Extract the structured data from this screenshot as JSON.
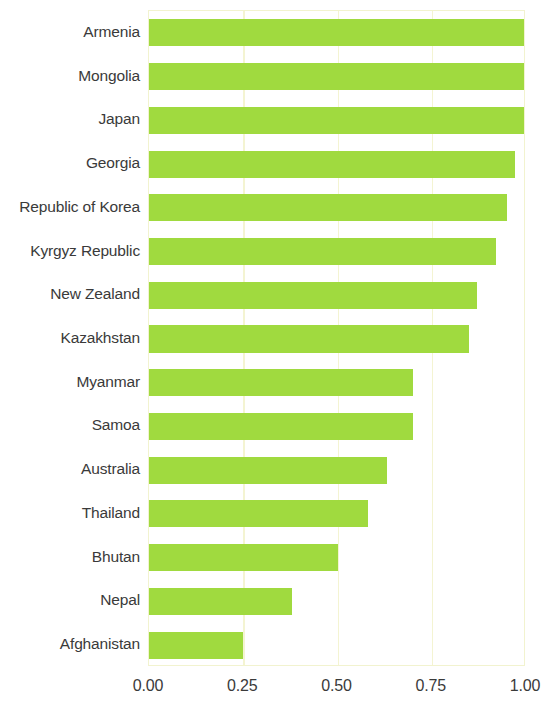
{
  "chart_data": {
    "type": "bar",
    "orientation": "horizontal",
    "title": "",
    "subtitle": "",
    "xlabel": "",
    "ylabel": "",
    "xlim": [
      0.0,
      1.0
    ],
    "xticks": [
      0.0,
      0.25,
      0.5,
      0.75,
      1.0
    ],
    "xtick_labels": [
      "0.00",
      "0.25",
      "0.50",
      "0.75",
      "1.00"
    ],
    "grid": true,
    "grid_axis": "x",
    "grid_color": "#f4f4d2",
    "legend": null,
    "bar_color": "#a0da3f",
    "categories": [
      "Armenia",
      "Mongolia",
      "Japan",
      "Georgia",
      "Republic of Korea",
      "Kyrgyz Republic",
      "New Zealand",
      "Kazakhstan",
      "Myanmar",
      "Samoa",
      "Australia",
      "Thailand",
      "Bhutan",
      "Nepal",
      "Afghanistan"
    ],
    "values": [
      1.0,
      1.0,
      1.0,
      0.97,
      0.95,
      0.92,
      0.87,
      0.85,
      0.7,
      0.7,
      0.63,
      0.58,
      0.5,
      0.38,
      0.25
    ]
  }
}
